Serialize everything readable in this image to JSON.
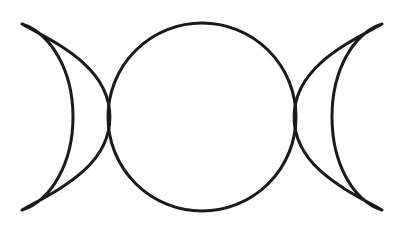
{
  "page": {
    "title": "Triple Moon Symbol",
    "width": 405,
    "height": 234,
    "background_color": "#ffffff",
    "media": "scanned line drawing"
  },
  "symbol": {
    "name": "triple-moon",
    "alt_names": [
      "Triple Goddess",
      "Maiden Mother Crone"
    ],
    "caption": "Triple Moon symbol: waxing crescent, full moon, waning crescent",
    "stroke_color": "#1a1a1a",
    "stroke_width": 3,
    "fill": "none",
    "parts": [
      {
        "id": "waxing-crescent",
        "label": "Waxing crescent (left)",
        "tip_top": [
          22,
          24
        ],
        "tip_bottom": [
          22,
          210
        ],
        "outer_extent_x": 73,
        "inner_edge": "shared with full moon left limb"
      },
      {
        "id": "full-moon",
        "label": "Full moon (center circle)",
        "center": [
          202,
          117
        ],
        "radius": 94,
        "bounds": [
          107,
          24,
          297,
          211
        ]
      },
      {
        "id": "waning-crescent",
        "label": "Waning crescent (right)",
        "tip_top": [
          382,
          24
        ],
        "tip_bottom": [
          382,
          210
        ],
        "outer_extent_x": 332,
        "inner_edge": "shared with full moon right limb"
      }
    ],
    "crossing_points": [
      {
        "id": "left-crossing",
        "x": 110,
        "y": 117
      },
      {
        "id": "right-crossing",
        "x": 294,
        "y": 117
      }
    ]
  }
}
